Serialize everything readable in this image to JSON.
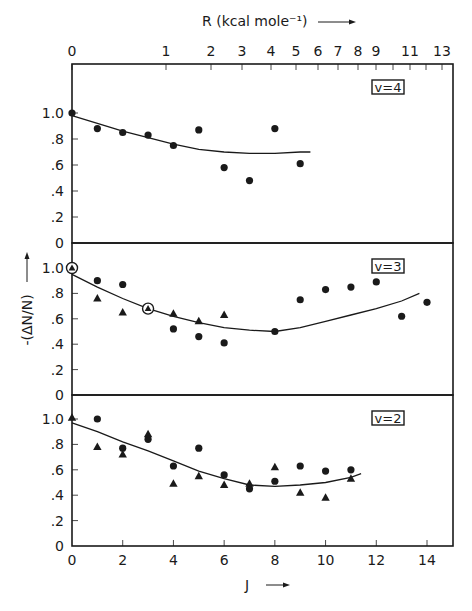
{
  "chart_data": {
    "type": "scatter",
    "title": "",
    "layout": "three vertically stacked panels sharing J (bottom) and R (top) axes",
    "xlabel": "J",
    "xlabel_arrow": "→",
    "x_ticks": [
      0,
      2,
      4,
      6,
      8,
      10,
      12,
      14
    ],
    "xlim": [
      0,
      15
    ],
    "top_axis": {
      "label": "R (kcal mole⁻¹)",
      "arrow": "→",
      "ticks": [
        {
          "label": "0",
          "x": 72
        },
        {
          "label": "1",
          "x": 166
        },
        {
          "label": "2",
          "x": 211
        },
        {
          "label": "3",
          "x": 242
        },
        {
          "label": "4",
          "x": 271
        },
        {
          "label": "5",
          "x": 296
        },
        {
          "label": "6",
          "x": 318
        },
        {
          "label": "7",
          "x": 338
        },
        {
          "label": "8",
          "x": 358
        },
        {
          "label": "9",
          "x": 376
        },
        {
          "label": "",
          "x": 393
        },
        {
          "label": "11",
          "x": 410
        },
        {
          "label": "",
          "x": 426
        },
        {
          "label": "13",
          "x": 442
        }
      ]
    },
    "ylabel": "-(ΔN/N)",
    "ylabel_arrow": "↑",
    "y_ticks": [
      {
        "value": 0,
        "label": "0"
      },
      {
        "value": 0.2,
        "label": ".2"
      },
      {
        "value": 0.4,
        "label": ".4"
      },
      {
        "value": 0.6,
        "label": ".6"
      },
      {
        "value": 0.8,
        "label": ".8"
      },
      {
        "value": 1.0,
        "label": "1.0"
      }
    ],
    "ylim": [
      0,
      1.2
    ],
    "grid": false,
    "legend": "none (markers: filled circle, filled triangle; circled markers at select points)",
    "panels": [
      {
        "label": "v=4",
        "series": [
          {
            "name": "circles",
            "marker": "circle",
            "points": [
              [
                0,
                1.0
              ],
              [
                1,
                0.88
              ],
              [
                2,
                0.85
              ],
              [
                3,
                0.83
              ],
              [
                4,
                0.75
              ],
              [
                5,
                0.87
              ],
              [
                6,
                0.58
              ],
              [
                7,
                0.48
              ],
              [
                8,
                0.88
              ],
              [
                9,
                0.61
              ]
            ]
          }
        ],
        "fit_curve": [
          [
            0,
            0.98
          ],
          [
            1,
            0.92
          ],
          [
            2,
            0.86
          ],
          [
            3,
            0.81
          ],
          [
            4,
            0.76
          ],
          [
            5,
            0.72
          ],
          [
            6,
            0.7
          ],
          [
            7,
            0.69
          ],
          [
            8,
            0.69
          ],
          [
            9,
            0.7
          ],
          [
            9.4,
            0.7
          ]
        ]
      },
      {
        "label": "v=3",
        "series": [
          {
            "name": "circles",
            "marker": "circle",
            "points": [
              [
                1,
                0.9
              ],
              [
                2,
                0.87
              ],
              [
                4,
                0.52
              ],
              [
                5,
                0.46
              ],
              [
                6,
                0.41
              ],
              [
                8,
                0.5
              ],
              [
                9,
                0.75
              ],
              [
                10,
                0.83
              ],
              [
                11,
                0.85
              ],
              [
                12,
                0.89
              ],
              [
                13,
                0.62
              ],
              [
                14,
                0.73
              ]
            ]
          },
          {
            "name": "triangles",
            "marker": "triangle",
            "points": [
              [
                1,
                0.76
              ],
              [
                2,
                0.65
              ],
              [
                4,
                0.64
              ],
              [
                5,
                0.58
              ],
              [
                6,
                0.63
              ]
            ]
          },
          {
            "name": "circled",
            "marker": "circled-triangle",
            "points": [
              [
                0,
                1.0
              ],
              [
                3,
                0.68
              ]
            ]
          }
        ],
        "fit_curve": [
          [
            0,
            0.95
          ],
          [
            1,
            0.85
          ],
          [
            2,
            0.76
          ],
          [
            3,
            0.68
          ],
          [
            4,
            0.62
          ],
          [
            5,
            0.57
          ],
          [
            6,
            0.53
          ],
          [
            7,
            0.51
          ],
          [
            8,
            0.5
          ],
          [
            9,
            0.53
          ],
          [
            10,
            0.58
          ],
          [
            11,
            0.63
          ],
          [
            12,
            0.68
          ],
          [
            13,
            0.74
          ],
          [
            13.7,
            0.8
          ]
        ]
      },
      {
        "label": "v=2",
        "series": [
          {
            "name": "circles",
            "marker": "circle",
            "points": [
              [
                1,
                1.0
              ],
              [
                2,
                0.77
              ],
              [
                3,
                0.84
              ],
              [
                4,
                0.63
              ],
              [
                5,
                0.77
              ],
              [
                6,
                0.56
              ],
              [
                7,
                0.45
              ],
              [
                8,
                0.51
              ],
              [
                9,
                0.63
              ],
              [
                10,
                0.59
              ],
              [
                11,
                0.6
              ]
            ]
          },
          {
            "name": "triangles",
            "marker": "triangle",
            "points": [
              [
                0,
                1.01
              ],
              [
                1,
                0.78
              ],
              [
                2,
                0.72
              ],
              [
                3,
                0.88
              ],
              [
                4,
                0.49
              ],
              [
                5,
                0.55
              ],
              [
                6,
                0.48
              ],
              [
                7,
                0.49
              ],
              [
                8,
                0.62
              ],
              [
                9,
                0.42
              ],
              [
                10,
                0.38
              ],
              [
                11,
                0.53
              ]
            ]
          }
        ],
        "fit_curve": [
          [
            0,
            0.97
          ],
          [
            1,
            0.9
          ],
          [
            2,
            0.82
          ],
          [
            3,
            0.75
          ],
          [
            4,
            0.67
          ],
          [
            5,
            0.59
          ],
          [
            6,
            0.53
          ],
          [
            7,
            0.48
          ],
          [
            8,
            0.47
          ],
          [
            9,
            0.48
          ],
          [
            10,
            0.5
          ],
          [
            11,
            0.54
          ],
          [
            11.4,
            0.57
          ]
        ]
      }
    ]
  },
  "colors": {
    "ink": "#1a1a1a",
    "background": "#ffffff"
  }
}
